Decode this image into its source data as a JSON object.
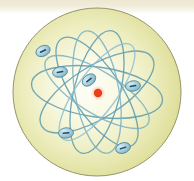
{
  "figure": {
    "background_color": "#ffffff",
    "top_band_color": "#ece6cf"
  },
  "disc": {
    "name": "atom-disc",
    "center_x": 97,
    "center_y": 92,
    "radius": 84,
    "fill_center_color": "#fdfdf5",
    "fill_edge_color": "#dcdc96",
    "stroke_color": "#8a8a60",
    "stroke_width": 0.9
  },
  "nucleus": {
    "name": "nucleus",
    "label": "nucleus",
    "x": 98,
    "y": 93,
    "radius": 4.2,
    "color": "#e8401a",
    "halo_color": "#f0a08a"
  },
  "orbits": {
    "stroke_color": "#5a9aae",
    "stroke_color_light": "#8fc0cf",
    "stroke_width": 1.3,
    "count": 7,
    "ellipses": [
      {
        "rx": 66,
        "ry": 25,
        "rotation": 8,
        "cx": 97,
        "cy": 92
      },
      {
        "rx": 64,
        "ry": 24,
        "rotation": 56,
        "cx": 97,
        "cy": 92
      },
      {
        "rx": 63,
        "ry": 23,
        "rotation": 104,
        "cx": 97,
        "cy": 92
      },
      {
        "rx": 65,
        "ry": 26,
        "rotation": 148,
        "cx": 97,
        "cy": 92
      },
      {
        "rx": 60,
        "ry": 21,
        "rotation": 32,
        "cx": 97,
        "cy": 92
      },
      {
        "rx": 62,
        "ry": 22,
        "rotation": 80,
        "cx": 97,
        "cy": 92
      },
      {
        "rx": 58,
        "ry": 20,
        "rotation": 126,
        "cx": 97,
        "cy": 92
      }
    ]
  },
  "electrons": {
    "charge_symbol": "−",
    "fill_color": "#a9cfdd",
    "stroke_color": "#4b8498",
    "symbol_color": "#1d4a5c",
    "rx": 7.5,
    "ry": 5.2,
    "items": [
      {
        "name": "electron-1",
        "x": 43,
        "y": 51,
        "rotation": -25
      },
      {
        "name": "electron-2",
        "x": 60,
        "y": 72,
        "rotation": -12
      },
      {
        "name": "electron-3",
        "x": 89,
        "y": 80,
        "rotation": -38
      },
      {
        "name": "electron-4",
        "x": 133,
        "y": 86,
        "rotation": -8
      },
      {
        "name": "electron-5",
        "x": 66,
        "y": 133,
        "rotation": -5
      },
      {
        "name": "electron-6",
        "x": 123,
        "y": 148,
        "rotation": -18
      }
    ]
  }
}
